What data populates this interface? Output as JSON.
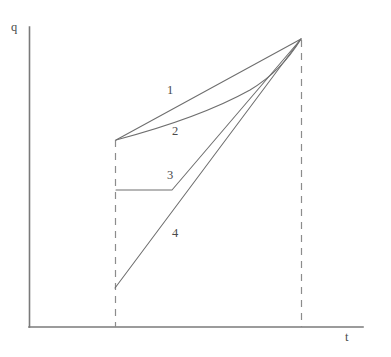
{
  "figure": {
    "title": "",
    "background_color": "#ffffff",
    "line_color": "#6e6e6e",
    "axis_color": "#7a7a7a",
    "dash_color": "#8c8c8c",
    "text_color": "#4a4a4a"
  },
  "axes": {
    "y_label": "q",
    "x_label": "t",
    "y_axis": {
      "x": 29,
      "y_top": 27,
      "y_bottom": 327
    },
    "x_axis": {
      "y": 327,
      "x_left": 29,
      "x_right": 363
    },
    "ticks": [],
    "grid": false
  },
  "markers": {
    "dashed_verticals": [
      {
        "name": "t-start-marker",
        "x": 115,
        "y_top": 140,
        "y_bottom": 327
      },
      {
        "name": "t-end-marker",
        "x": 301,
        "y_top": 40,
        "y_bottom": 327
      }
    ],
    "convergence_point": {
      "x": 301,
      "y": 39
    }
  },
  "curve_labels": [
    {
      "id": "1",
      "text": "1"
    },
    {
      "id": "2",
      "text": "2"
    },
    {
      "id": "3",
      "text": "3"
    },
    {
      "id": "4",
      "text": "4"
    }
  ],
  "chart_data": {
    "type": "line",
    "title": "",
    "xlabel": "t",
    "ylabel": "q",
    "xlim": [
      0,
      1
    ],
    "ylim": [
      0,
      1
    ],
    "grid": false,
    "legend": "inline-numeric-labels",
    "axis_ticks": {
      "x": [],
      "y": []
    },
    "annotations": [
      {
        "text": "1",
        "x_px": 167,
        "y_px": 84
      },
      {
        "text": "2",
        "x_px": 172,
        "y_px": 125
      },
      {
        "text": "3",
        "x_px": 167,
        "y_px": 169
      },
      {
        "text": "4",
        "x_px": 172,
        "y_px": 227
      }
    ],
    "series": [
      {
        "name": "1",
        "shape": "straight",
        "points_px": [
          [
            116,
            140
          ],
          [
            301,
            39
          ]
        ],
        "path": "M 116 140 L 301 39"
      },
      {
        "name": "2",
        "shape": "concave-curve",
        "points_px": [
          [
            116,
            140
          ],
          [
            168,
            126
          ],
          [
            220,
            104
          ],
          [
            262,
            76
          ],
          [
            301,
            39
          ]
        ],
        "path": "M 116 140 C 150 131 205 115 250 90 C 275 75 290 57 301 39"
      },
      {
        "name": "3",
        "shape": "flat-then-straight",
        "points_px": [
          [
            116,
            190
          ],
          [
            172,
            190
          ],
          [
            301,
            39
          ]
        ],
        "path": "M 116 190 L 172 190 L 301 39"
      },
      {
        "name": "4",
        "shape": "straight",
        "points_px": [
          [
            115,
            288
          ],
          [
            301,
            39
          ]
        ],
        "path": "M 115 288 L 301 39"
      }
    ]
  }
}
